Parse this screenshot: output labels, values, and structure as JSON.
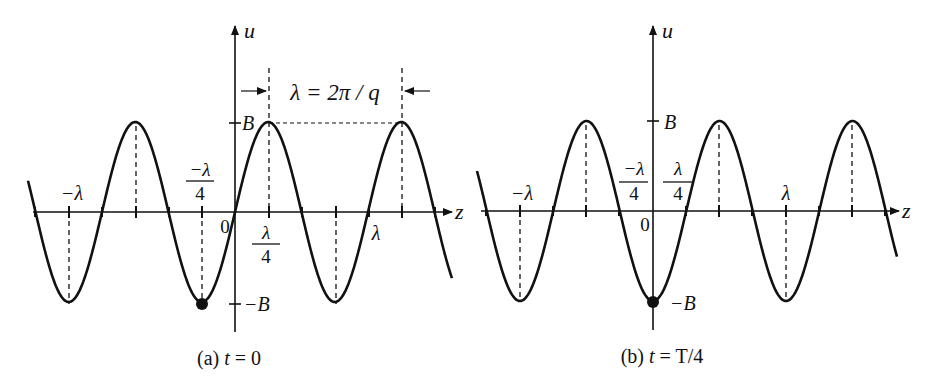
{
  "figure": {
    "stroke_color": "#111111",
    "background": "#ffffff"
  },
  "panels": [
    {
      "id": "a",
      "caption_prefix": "(a) ",
      "caption_var": "t",
      "caption_rest": " = 0",
      "axis_labels": {
        "vertical": "u",
        "horizontal": "z"
      },
      "origin_label": "0",
      "amplitude_labels": {
        "top": "B",
        "bottom": "−B"
      },
      "tick_labels": {
        "neg_lambda": "−λ",
        "neg_quarter_num": "−λ",
        "neg_quarter_den": "4",
        "pos_quarter_num": "λ",
        "pos_quarter_den": "4",
        "lambda": "λ"
      },
      "wavelength_annotation": "λ = 2π / q",
      "geometry": {
        "x0": 235,
        "y0": 212,
        "amp": 90,
        "period": 133,
        "xmin": 28,
        "xmax": 452,
        "phase": "sin"
      },
      "marked_point": {
        "z_label": "−λ/4",
        "u_label": "−B"
      }
    },
    {
      "id": "b",
      "caption_prefix": "(b) ",
      "caption_var": "t",
      "caption_rest": " = T/4",
      "axis_labels": {
        "vertical": "u",
        "horizontal": "z"
      },
      "origin_label": "0",
      "amplitude_labels": {
        "top": "B",
        "bottom": "−B"
      },
      "tick_labels": {
        "neg_lambda": "−λ",
        "neg_quarter_num": "−λ",
        "neg_quarter_den": "4",
        "pos_quarter_num": "λ",
        "pos_quarter_den": "4",
        "lambda": "λ"
      },
      "geometry": {
        "x0": 653,
        "y0": 211,
        "amp": 90,
        "period": 133,
        "xmin": 477,
        "xmax": 897,
        "phase": "-cos"
      },
      "marked_point": {
        "z_label": "0",
        "u_label": "−B"
      }
    }
  ]
}
